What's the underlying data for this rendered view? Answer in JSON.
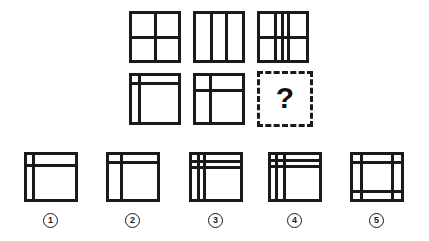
{
  "puzzle": {
    "type": "visual-analogy-matrix",
    "title": "",
    "stroke_color": "#1a1a1a",
    "background_color": "#ffffff",
    "missing_cell_symbol": "?",
    "matrix": {
      "rows": 2,
      "cols": 3,
      "cells": [
        {
          "id": "cell-r1c1",
          "name": "square-2x2-grid",
          "x": 129,
          "y": 11,
          "w": 52,
          "h": 52,
          "vlines": [
            50
          ],
          "hlines": [
            50
          ],
          "dashed": false
        },
        {
          "id": "cell-r1c2",
          "name": "square-three-columns",
          "x": 193,
          "y": 11,
          "w": 52,
          "h": 52,
          "vlines": [
            33,
            66
          ],
          "hlines": [],
          "dashed": false
        },
        {
          "id": "cell-r1c3",
          "name": "square-overlay-columns-and-row",
          "x": 257,
          "y": 11,
          "w": 52,
          "h": 52,
          "vlines": [
            33,
            48,
            62
          ],
          "hlines": [
            50
          ],
          "dashed": false
        },
        {
          "id": "cell-r2c1",
          "name": "square-narrow-left-and-top-bands",
          "x": 129,
          "y": 73,
          "w": 52,
          "h": 52,
          "vlines": [
            17
          ],
          "hlines": [
            17
          ],
          "dashed": false
        },
        {
          "id": "cell-r2c2",
          "name": "square-left-and-top-bands",
          "x": 193,
          "y": 73,
          "w": 52,
          "h": 52,
          "vlines": [
            31
          ],
          "hlines": [
            31
          ],
          "dashed": false
        },
        {
          "id": "cell-r2c3",
          "name": "missing-cell-question-mark",
          "x": 257,
          "y": 71,
          "w": 56,
          "h": 56,
          "vlines": [],
          "hlines": [],
          "dashed": true
        }
      ]
    },
    "options": [
      {
        "id": "option-1",
        "label": "1",
        "name": "answer-option-1",
        "x": 24,
        "y": 152,
        "w": 54,
        "h": 50,
        "vlines": [
          14
        ],
        "hlines": [
          24
        ],
        "badge_x": 43,
        "badge_y": 213
      },
      {
        "id": "option-2",
        "label": "2",
        "name": "answer-option-2",
        "x": 106,
        "y": 152,
        "w": 54,
        "h": 50,
        "vlines": [
          26
        ],
        "hlines": [
          18
        ],
        "badge_x": 125,
        "badge_y": 213
      },
      {
        "id": "option-3",
        "label": "3",
        "name": "answer-option-3",
        "x": 189,
        "y": 152,
        "w": 54,
        "h": 50,
        "vlines": [
          13,
          26
        ],
        "hlines": [
          14,
          28
        ],
        "badge_x": 208,
        "badge_y": 213
      },
      {
        "id": "option-4",
        "label": "4",
        "name": "answer-option-4",
        "x": 268,
        "y": 152,
        "w": 54,
        "h": 50,
        "vlines": [
          11,
          28
        ],
        "hlines": [
          12,
          26
        ],
        "badge_x": 287,
        "badge_y": 213
      },
      {
        "id": "option-5",
        "label": "5",
        "name": "answer-option-5",
        "x": 350,
        "y": 152,
        "w": 54,
        "h": 50,
        "vlines": [
          17,
          82
        ],
        "hlines": [
          17,
          82
        ],
        "badge_x": 369,
        "badge_y": 213
      }
    ]
  }
}
